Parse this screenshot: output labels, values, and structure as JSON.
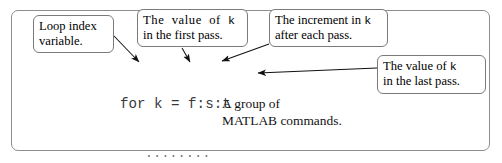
{
  "figure": {
    "type": "matlab-for-loop-annotated-syntax-diagram",
    "frame": {
      "border_color": "#8d8d8d"
    }
  },
  "callouts": [
    {
      "name": "loop-index",
      "line1": "Loop index",
      "line2": "variable."
    },
    {
      "name": "first-pass",
      "line1_pre": "The  value  of  ",
      "line1_code": "k",
      "line2": "in the first pass."
    },
    {
      "name": "increment",
      "line1_pre": "The increment in ",
      "line1_code": "k",
      "line2": "after each pass."
    },
    {
      "name": "last-pass",
      "line1_pre": "The value of ",
      "line1_code": "k",
      "line2": "in the last pass."
    }
  ],
  "code": {
    "line_for": "for k = f:s:t",
    "dots1": "........",
    "dots2": "........",
    "dots3": "........",
    "line_end": "end"
  },
  "note": {
    "line1": "A group of",
    "line2": "MATLAB commands."
  },
  "colors": {
    "ink": "#000000",
    "code_ink": "#3a3a3a",
    "box_border": "#7a7a7a",
    "frame_border": "#8d8d8d",
    "arrow": "#111111",
    "background": "#ffffff"
  }
}
